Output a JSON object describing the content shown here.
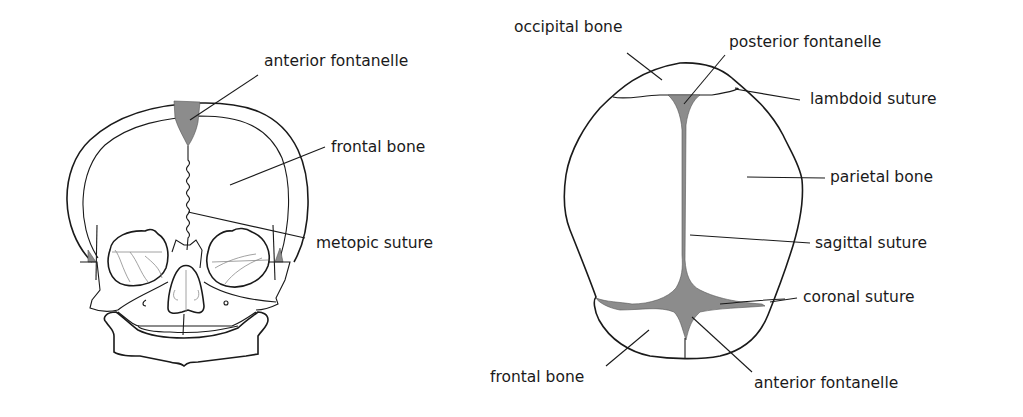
{
  "colors": {
    "background": "#ffffff",
    "outline": "#1a1a1a",
    "fontanelle_fill": "#8c8c8c"
  },
  "front_view": {
    "labels": {
      "anterior_fontanelle": "anterior fontanelle",
      "frontal_bone": "frontal bone",
      "metopic_suture": "metopic suture"
    }
  },
  "top_view": {
    "labels": {
      "occipital_bone": "occipital bone",
      "posterior_fontanelle": "posterior fontanelle",
      "lambdoid_suture": "lambdoid suture",
      "parietal_bone": "parietal bone",
      "sagittal_suture": "sagittal suture",
      "coronal_suture": "coronal suture",
      "frontal_bone": "frontal bone",
      "anterior_fontanelle": "anterior fontanelle"
    }
  }
}
